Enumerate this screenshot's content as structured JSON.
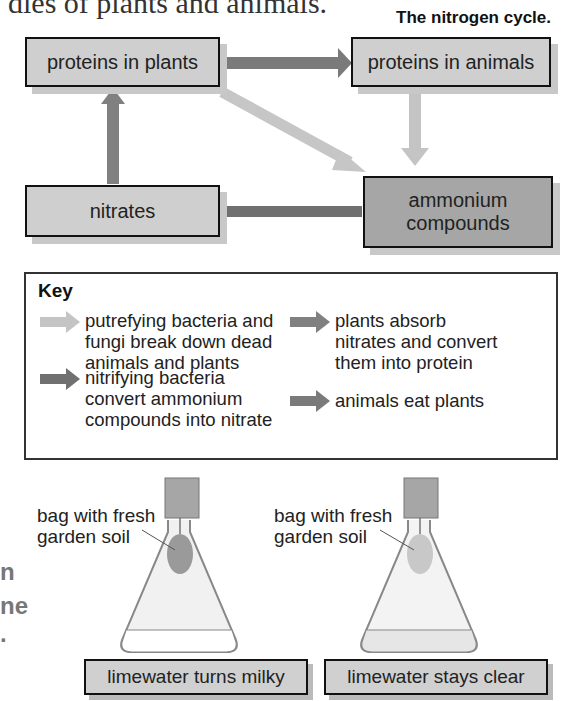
{
  "page": {
    "top_text_fragment": "dies of plants and animals.",
    "title": "The nitrogen cycle."
  },
  "diagram": {
    "nodes": [
      {
        "id": "proteins-in-plants",
        "label": "proteins in plants"
      },
      {
        "id": "proteins-in-animals",
        "label": "proteins in animals"
      },
      {
        "id": "nitrates",
        "label": "nitrates"
      },
      {
        "id": "ammonium-compounds",
        "label": "ammonium compounds"
      }
    ],
    "edges": [
      {
        "from": "proteins-in-plants",
        "to": "proteins-in-animals",
        "type": "animals eat plants",
        "color": "#7a7a7a"
      },
      {
        "from": "proteins-in-plants",
        "to": "ammonium-compounds",
        "type": "putrefying",
        "color": "#c4c4c4"
      },
      {
        "from": "proteins-in-animals",
        "to": "ammonium-compounds",
        "type": "putrefying",
        "color": "#c4c4c4"
      },
      {
        "from": "ammonium-compounds",
        "to": "nitrates",
        "type": "nitrifying",
        "color": "#707070"
      },
      {
        "from": "nitrates",
        "to": "proteins-in-plants",
        "type": "plants absorb",
        "color": "#808080"
      }
    ]
  },
  "key": {
    "title": "Key",
    "items": [
      {
        "text": "putrefying bacteria and fungi break down dead animals and plants",
        "lines": [
          "putrefying bacteria and",
          "fungi break down dead",
          "animals and plants"
        ],
        "color": "#c4c4c4"
      },
      {
        "text": "plants absorb nitrates and convert them into protein",
        "lines": [
          "plants absorb",
          "nitrates and convert",
          "them into protein"
        ],
        "color": "#808080"
      },
      {
        "text": "nitrifying bacteria convert ammonium compounds into nitrate",
        "lines": [
          "nitrifying bacteria",
          "convert ammonium",
          "compounds into nitrate"
        ],
        "color": "#707070"
      },
      {
        "text": "animals eat plants",
        "lines": [
          "animals eat plants"
        ],
        "color": "#7a7a7a"
      }
    ]
  },
  "side_fragments": [
    "n",
    "ne",
    "."
  ],
  "experiment": {
    "flasks": [
      {
        "label_lines": [
          "bag with fresh",
          "garden soil"
        ],
        "result": "limewater turns milky",
        "bag_color": "#9a9a9a"
      },
      {
        "label_lines": [
          "bag with fresh",
          "garden soil"
        ],
        "result": "limewater stays clear",
        "bag_color": "#c8c8c8"
      }
    ]
  }
}
